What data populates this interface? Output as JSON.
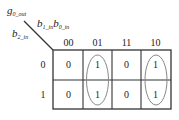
{
  "kmap": {
    "output_var": {
      "base": "g",
      "sub": "0_out"
    },
    "row_var": {
      "base": "b",
      "sub": "2_in"
    },
    "col_vars": [
      {
        "base": "b",
        "sub": "1_in"
      },
      {
        "base": "b",
        "sub": "0_in"
      }
    ],
    "col_headers": [
      "00",
      "01",
      "11",
      "10"
    ],
    "row_headers": [
      "0",
      "1"
    ],
    "cells": [
      [
        "0",
        "1",
        "0",
        "1"
      ],
      [
        "0",
        "1",
        "0",
        "1"
      ]
    ],
    "groups": [
      {
        "column": "01",
        "rows": [
          "0",
          "1"
        ]
      },
      {
        "column": "10",
        "rows": [
          "0",
          "1"
        ]
      }
    ],
    "colors": {
      "grid": "#333333",
      "ellipse": "#888888",
      "text": "#222222"
    }
  }
}
